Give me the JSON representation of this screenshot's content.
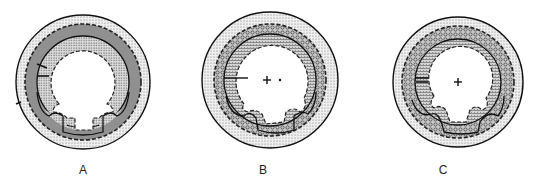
{
  "panels": [
    {
      "label": "A",
      "cx": 83,
      "cy": 82,
      "r": 67,
      "label_x": 83,
      "label_y": 163,
      "marks": [
        "arrows-left"
      ],
      "center_marks": []
    },
    {
      "label": "B",
      "cx": 270,
      "cy": 80,
      "r": 68,
      "label_x": 263,
      "label_y": 163,
      "marks": [
        "line-left"
      ],
      "center_marks": [
        "plus",
        "dot"
      ]
    },
    {
      "label": "C",
      "cx": 458,
      "cy": 82,
      "r": 65,
      "label_x": 443,
      "label_y": 163,
      "marks": [
        "arrows-left"
      ],
      "center_marks": [
        "plus"
      ]
    }
  ],
  "colors": {
    "outline": "#111111",
    "light_stipple": "#d9d9d9",
    "medium_stipple": "#b8b8b8",
    "dark_stipple": "#9a9a9a",
    "background": "#ffffff"
  }
}
